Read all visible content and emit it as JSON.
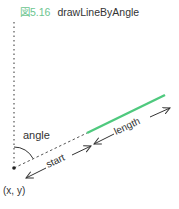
{
  "figure": {
    "number": "図5.16",
    "name": "drawLineByAngle"
  },
  "labels": {
    "angle": "angle",
    "start": "start",
    "length": "length",
    "origin": "(x, y)"
  },
  "colors": {
    "line": "#4fc97e",
    "figure_number": "#6cc58f",
    "text": "#333333"
  }
}
